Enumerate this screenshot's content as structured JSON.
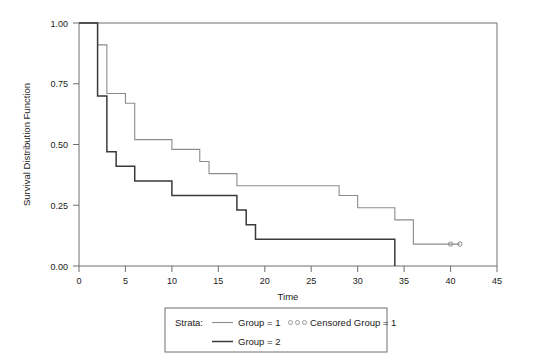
{
  "chart_data": {
    "type": "line",
    "subtype": "kaplan-meier-step",
    "title": "",
    "xlabel": "Time",
    "ylabel": "Survival Distribution Function",
    "xlim": [
      0,
      45
    ],
    "ylim": [
      0.0,
      1.0
    ],
    "xticks": [
      0,
      5,
      10,
      15,
      20,
      25,
      30,
      35,
      40,
      45
    ],
    "xticklabels": [
      "0",
      "5",
      "10",
      "15",
      "20",
      "25",
      "30",
      "35",
      "40",
      "45"
    ],
    "yticks": [
      0.0,
      0.25,
      0.5,
      0.75,
      1.0
    ],
    "yticklabels": [
      "0.00",
      "0.25",
      "0.50",
      "0.75",
      "1.00"
    ],
    "grid": false,
    "frame": "top-right-box",
    "legend_position": "below",
    "series": [
      {
        "name": "Group = 1",
        "color": "#8c8c8c",
        "linewidth": 1.1,
        "step": "post",
        "x": [
          0,
          1,
          2,
          3,
          5,
          6,
          10,
          13,
          14,
          17,
          28,
          30,
          34,
          36,
          41
        ],
        "y": [
          1.0,
          1.0,
          0.91,
          0.71,
          0.67,
          0.52,
          0.48,
          0.43,
          0.38,
          0.33,
          0.29,
          0.24,
          0.19,
          0.09,
          0.09
        ],
        "censored": {
          "x": [
            40,
            41
          ],
          "y": [
            0.09,
            0.09
          ],
          "marker": "circle-open"
        }
      },
      {
        "name": "Group = 2",
        "color": "#3a3a3a",
        "linewidth": 1.5,
        "step": "post",
        "x": [
          0,
          1,
          2,
          3,
          4,
          5,
          6,
          10,
          17,
          18,
          19,
          34,
          34
        ],
        "y": [
          1.0,
          1.0,
          0.7,
          0.47,
          0.41,
          0.41,
          0.35,
          0.29,
          0.23,
          0.17,
          0.11,
          0.05,
          0.0
        ]
      }
    ]
  },
  "legend": {
    "strata_label": "Strata:",
    "entries": [
      {
        "label": "Group = 1",
        "style": "line",
        "color": "#8c8c8c"
      },
      {
        "label": "Censored Group = 1",
        "style": "circles",
        "color": "#8c8c8c"
      },
      {
        "label": "Group = 2",
        "style": "line",
        "color": "#3a3a3a"
      }
    ]
  }
}
